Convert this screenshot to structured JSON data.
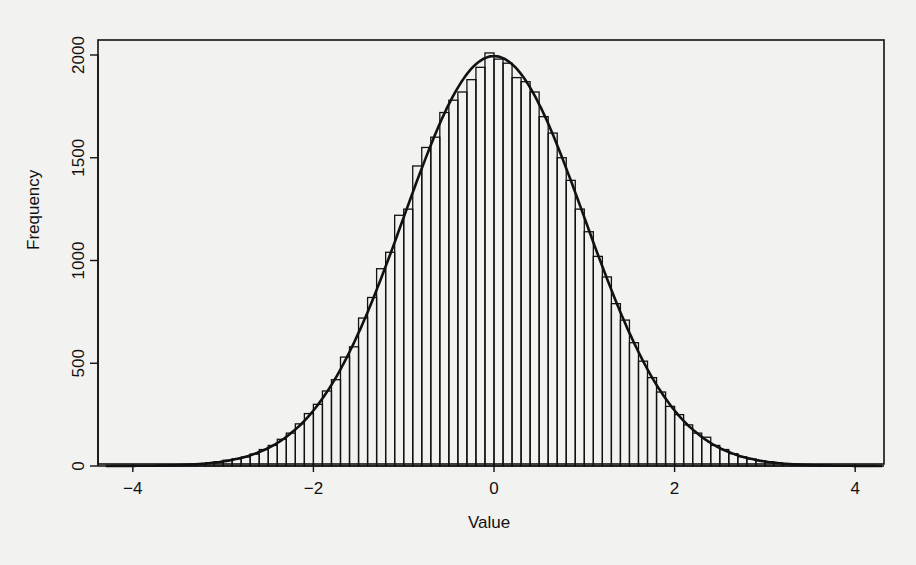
{
  "chart_data": {
    "type": "bar",
    "title": "",
    "xlabel": "Value",
    "ylabel": "Frequency",
    "xlim": [
      -4.3,
      4.3
    ],
    "ylim": [
      0,
      2050
    ],
    "x_ticks": [
      -4,
      -2,
      0,
      2,
      4
    ],
    "x_tick_labels": [
      "−4",
      "−2",
      "0",
      "2",
      "4"
    ],
    "y_ticks": [
      0,
      500,
      1000,
      1500,
      2000
    ],
    "y_tick_labels": [
      "0",
      "500",
      "1000",
      "1500",
      "2000"
    ],
    "grid": false,
    "legend": null,
    "bin_width": 0.1,
    "bin_start": -4.0,
    "overlay": "normal density curve (mean 0, sd 1) scaled to counts",
    "categories": [
      "-3.95",
      "-3.85",
      "-3.75",
      "-3.65",
      "-3.55",
      "-3.45",
      "-3.35",
      "-3.25",
      "-3.15",
      "-3.05",
      "-2.95",
      "-2.85",
      "-2.75",
      "-2.65",
      "-2.55",
      "-2.45",
      "-2.35",
      "-2.25",
      "-2.15",
      "-2.05",
      "-1.95",
      "-1.85",
      "-1.75",
      "-1.65",
      "-1.55",
      "-1.45",
      "-1.35",
      "-1.25",
      "-1.15",
      "-1.05",
      "-0.95",
      "-0.85",
      "-0.75",
      "-0.65",
      "-0.55",
      "-0.45",
      "-0.35",
      "-0.25",
      "-0.15",
      "-0.05",
      "0.05",
      "0.15",
      "0.25",
      "0.35",
      "0.45",
      "0.55",
      "0.65",
      "0.75",
      "0.85",
      "0.95",
      "1.05",
      "1.15",
      "1.25",
      "1.35",
      "1.45",
      "1.55",
      "1.65",
      "1.75",
      "1.85",
      "1.95",
      "2.05",
      "2.15",
      "2.25",
      "2.35",
      "2.45",
      "2.55",
      "2.65",
      "2.75",
      "2.85",
      "2.95",
      "3.05",
      "3.15",
      "3.25",
      "3.35",
      "3.45",
      "3.55",
      "3.65",
      "3.75",
      "3.85",
      "3.95"
    ],
    "values": [
      1,
      1,
      2,
      3,
      4,
      5,
      7,
      10,
      14,
      20,
      28,
      35,
      44,
      58,
      80,
      100,
      130,
      160,
      205,
      255,
      300,
      365,
      420,
      530,
      580,
      720,
      820,
      960,
      1040,
      1220,
      1250,
      1460,
      1550,
      1600,
      1720,
      1780,
      1820,
      1880,
      1940,
      2010,
      1980,
      1960,
      1890,
      1870,
      1820,
      1700,
      1620,
      1500,
      1390,
      1250,
      1140,
      1020,
      920,
      790,
      710,
      600,
      510,
      430,
      360,
      290,
      250,
      200,
      160,
      140,
      100,
      80,
      60,
      45,
      34,
      26,
      19,
      14,
      10,
      7,
      5,
      4,
      3,
      2,
      1,
      1
    ]
  },
  "axes": {
    "xlabel": "Value",
    "ylabel": "Frequency"
  }
}
